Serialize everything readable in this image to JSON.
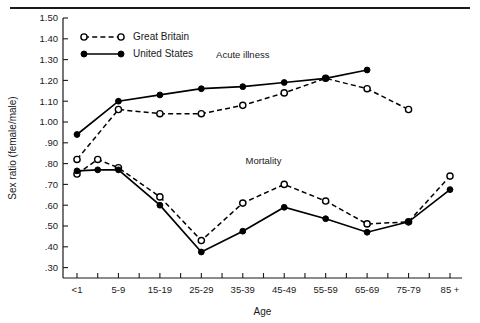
{
  "figure": {
    "top_rule": true
  },
  "chart_data": {
    "type": "line",
    "title": "",
    "xlabel": "Age",
    "ylabel": "Sex ratio (female/male)",
    "ylim": [
      0.25,
      1.5
    ],
    "yticks": [
      1.5,
      1.4,
      1.3,
      1.2,
      1.1,
      1.0,
      0.9,
      0.8,
      0.7,
      0.6,
      0.5,
      0.4,
      0.3
    ],
    "ytick_labels": [
      "1.50",
      "1.40",
      "1.30",
      "1.20",
      "1.10",
      "1.00",
      ".90",
      ".80",
      ".70",
      ".60",
      ".50",
      ".40",
      ".30"
    ],
    "categories": [
      "<1",
      "1-4",
      "5-9",
      "10-14",
      "15-19",
      "20-24",
      "25-29",
      "30-34",
      "35-39",
      "40-44",
      "45-49",
      "50-54",
      "55-59",
      "60-64",
      "65-69",
      "70-74",
      "75-79",
      "80-84",
      "85 +"
    ],
    "xtick_labels": [
      "<1",
      "",
      "5-9",
      "",
      "15-19",
      "",
      "25-29",
      "",
      "35-39",
      "",
      "45-49",
      "",
      "55-59",
      "",
      "65-69",
      "",
      "75-79",
      "",
      "85 +"
    ],
    "grid": false,
    "legend_position": "upper-left-inside",
    "annotations": [
      {
        "text": "Acute illness",
        "x_category": "35-39",
        "y": 1.31
      },
      {
        "text": "Mortality",
        "x_category": "40-44",
        "y": 0.8
      }
    ],
    "groups": [
      {
        "name": "Acute illness",
        "series": [
          {
            "name": "Great Britain",
            "marker": "open-circle",
            "line": "dashed",
            "color": "#000000",
            "points": [
              {
                "x": "<1",
                "y": 0.82
              },
              {
                "x": "5-9",
                "y": 1.06
              },
              {
                "x": "15-19",
                "y": 1.04
              },
              {
                "x": "25-29",
                "y": 1.04
              },
              {
                "x": "35-39",
                "y": 1.08
              },
              {
                "x": "45-49",
                "y": 1.14
              },
              {
                "x": "55-59",
                "y": 1.21
              },
              {
                "x": "65-69",
                "y": 1.16
              },
              {
                "x": "75-79",
                "y": 1.06
              }
            ]
          },
          {
            "name": "United States",
            "marker": "filled-circle",
            "line": "solid",
            "color": "#000000",
            "points": [
              {
                "x": "<1",
                "y": 0.94
              },
              {
                "x": "5-9",
                "y": 1.1
              },
              {
                "x": "15-19",
                "y": 1.13
              },
              {
                "x": "25-29",
                "y": 1.16
              },
              {
                "x": "35-39",
                "y": 1.17
              },
              {
                "x": "45-49",
                "y": 1.19
              },
              {
                "x": "55-59",
                "y": 1.21
              },
              {
                "x": "65-69",
                "y": 1.25
              }
            ]
          }
        ]
      },
      {
        "name": "Mortality",
        "series": [
          {
            "name": "Great Britain",
            "marker": "open-circle",
            "line": "dashed",
            "color": "#000000",
            "points": [
              {
                "x": "<1",
                "y": 0.75
              },
              {
                "x": "1-4",
                "y": 0.82
              },
              {
                "x": "5-9",
                "y": 0.78
              },
              {
                "x": "15-19",
                "y": 0.64
              },
              {
                "x": "25-29",
                "y": 0.43
              },
              {
                "x": "35-39",
                "y": 0.61
              },
              {
                "x": "45-49",
                "y": 0.7
              },
              {
                "x": "55-59",
                "y": 0.62
              },
              {
                "x": "65-69",
                "y": 0.51
              },
              {
                "x": "75-79",
                "y": 0.52
              },
              {
                "x": "85 +",
                "y": 0.74
              }
            ]
          },
          {
            "name": "United States",
            "marker": "filled-circle",
            "line": "solid",
            "color": "#000000",
            "points": [
              {
                "x": "<1",
                "y": 0.765
              },
              {
                "x": "1-4",
                "y": 0.77
              },
              {
                "x": "5-9",
                "y": 0.77
              },
              {
                "x": "15-19",
                "y": 0.6
              },
              {
                "x": "25-29",
                "y": 0.375
              },
              {
                "x": "35-39",
                "y": 0.475
              },
              {
                "x": "45-49",
                "y": 0.59
              },
              {
                "x": "55-59",
                "y": 0.535
              },
              {
                "x": "65-69",
                "y": 0.47
              },
              {
                "x": "75-79",
                "y": 0.52
              },
              {
                "x": "85 +",
                "y": 0.675
              }
            ]
          }
        ]
      }
    ],
    "legend": [
      {
        "label": "Great Britain",
        "marker": "open-circle",
        "line": "dashed"
      },
      {
        "label": "United States",
        "marker": "filled-circle",
        "line": "solid"
      }
    ]
  }
}
